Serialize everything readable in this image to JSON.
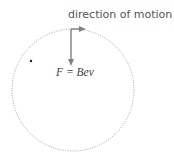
{
  "diagram": {
    "title_label": "direction of motion",
    "force_label": "F = Bev",
    "colors": {
      "orbit": "#888888",
      "arrow": "#808080",
      "text": "#555555",
      "dot": "#222222"
    },
    "orbit": {
      "cx": 73,
      "cy": 90,
      "r": 61,
      "style": "dotted"
    },
    "point": {
      "x": 31,
      "y": 61
    }
  }
}
